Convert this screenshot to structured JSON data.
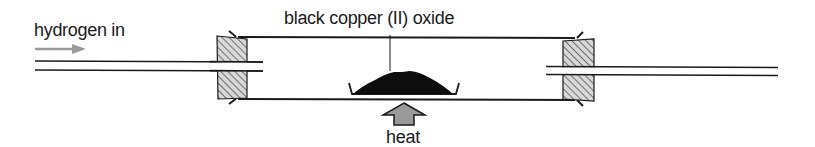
{
  "diagram": {
    "type": "apparatus",
    "labels": {
      "gas_inlet": "hydrogen in",
      "reactant": "black copper (II) oxide",
      "heat_source": "heat"
    },
    "colors": {
      "line": "#1a1a1a",
      "arrow_fill": "#9a9a9a",
      "bung_hatch": "#555555",
      "bung_fill": "#d8d8d8",
      "powder": "#0d0d0d"
    },
    "components": [
      {
        "id": "inlet-tube",
        "description": "narrow glass tube entering from left through bung"
      },
      {
        "id": "left-bung",
        "description": "hatched rubber stopper"
      },
      {
        "id": "combustion-tube",
        "description": "wide glass tube"
      },
      {
        "id": "boat",
        "description": "porcelain boat holding black copper (II) oxide"
      },
      {
        "id": "right-bung",
        "description": "hatched rubber stopper"
      },
      {
        "id": "outlet-tube",
        "description": "narrow glass tube leaving to the right"
      },
      {
        "id": "heat-arrow",
        "description": "upward grey arrow indicating heat applied under the boat"
      },
      {
        "id": "gas-flow-arrow",
        "description": "grey rightward arrow showing hydrogen flow direction"
      }
    ]
  }
}
